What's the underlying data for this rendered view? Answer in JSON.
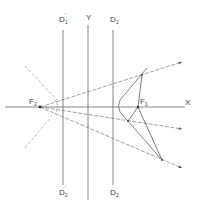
{
  "diagram": {
    "title": "",
    "labels": {
      "x_axis": "X",
      "y_axis": "Y",
      "d1": "D",
      "d1_sub": "1",
      "d1_prime": "D",
      "d1_prime_sub": "1",
      "d1_prime_sup": "'",
      "d2": "D",
      "d2_sub": "2",
      "d2_prime": "D",
      "d2_prime_sub": "2",
      "d2_prime_sup": "'",
      "f1": "F",
      "f1_sub": "1",
      "f2": "F",
      "f2_sub": "2"
    },
    "colors": {
      "line": "#555555",
      "dashed": "#8a8a8a",
      "background": "#ffffff"
    }
  }
}
